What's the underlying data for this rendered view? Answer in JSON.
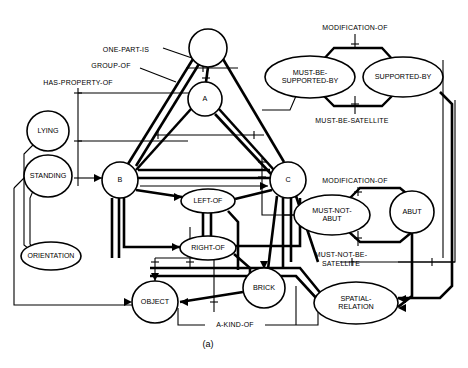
{
  "figure": {
    "caption": "(a)",
    "background_color": "#ffffff",
    "ink_color": "#000000"
  },
  "nodes": [
    {
      "id": "top",
      "label": "",
      "shape": "circle",
      "cx": 208,
      "cy": 48,
      "rx": 19,
      "ry": 19,
      "lines": []
    },
    {
      "id": "a",
      "label": "A",
      "shape": "circle",
      "cx": 205,
      "cy": 99,
      "rx": 17,
      "ry": 17,
      "lines": [
        "A"
      ]
    },
    {
      "id": "b",
      "label": "B",
      "shape": "circle",
      "cx": 120,
      "cy": 180,
      "rx": 18,
      "ry": 18,
      "lines": [
        "B"
      ]
    },
    {
      "id": "c",
      "label": "C",
      "shape": "circle",
      "cx": 288,
      "cy": 180,
      "rx": 18,
      "ry": 18,
      "lines": [
        "C"
      ]
    },
    {
      "id": "lying",
      "label": "LYING",
      "shape": "circle",
      "cx": 48,
      "cy": 131,
      "rx": 21,
      "ry": 20,
      "lines": [
        "LYING"
      ]
    },
    {
      "id": "standing",
      "label": "STANDING",
      "shape": "circle",
      "cx": 48,
      "cy": 176,
      "rx": 24,
      "ry": 21,
      "lines": [
        "STANDING"
      ]
    },
    {
      "id": "orientation",
      "label": "ORIENTATION",
      "shape": "ellipse",
      "cx": 51,
      "cy": 256,
      "rx": 30,
      "ry": 14,
      "lines": [
        "ORIENTATION"
      ]
    },
    {
      "id": "leftof",
      "label": "LEFT-OF",
      "shape": "ellipse",
      "cx": 208,
      "cy": 201,
      "rx": 27,
      "ry": 12,
      "lines": [
        "LEFT-OF"
      ]
    },
    {
      "id": "rightof",
      "label": "RIGHT-OF",
      "shape": "ellipse",
      "cx": 208,
      "cy": 248,
      "rx": 28,
      "ry": 12,
      "lines": [
        "RIGHT-OF"
      ]
    },
    {
      "id": "object",
      "label": "OBJECT",
      "shape": "circle",
      "cx": 155,
      "cy": 302,
      "rx": 23,
      "ry": 21,
      "lines": [
        "OBJECT"
      ]
    },
    {
      "id": "brick",
      "label": "BRICK",
      "shape": "circle",
      "cx": 264,
      "cy": 288,
      "rx": 21,
      "ry": 20,
      "lines": [
        "BRICK"
      ]
    },
    {
      "id": "mustbesup",
      "label": "MUST-BE-SUPPORTED-BY",
      "shape": "ellipse",
      "cx": 310,
      "cy": 77,
      "rx": 45,
      "ry": 21,
      "lines": [
        "MUST-BE-",
        "SUPPORTED-BY"
      ]
    },
    {
      "id": "supportedby",
      "label": "SUPPORTED-BY",
      "shape": "ellipse",
      "cx": 403,
      "cy": 77,
      "rx": 40,
      "ry": 20,
      "lines": [
        "SUPPORTED-BY"
      ]
    },
    {
      "id": "mustnotabut",
      "label": "MUST-NOT-ABUT",
      "shape": "ellipse",
      "cx": 332,
      "cy": 215,
      "rx": 38,
      "ry": 20,
      "lines": [
        "MUST-NOT-",
        "ABUT"
      ]
    },
    {
      "id": "abut",
      "label": "ABUT",
      "shape": "circle",
      "cx": 412,
      "cy": 212,
      "rx": 22,
      "ry": 21,
      "lines": [
        "ABUT"
      ]
    },
    {
      "id": "spatialrel",
      "label": "SPATIAL-RELATION",
      "shape": "ellipse",
      "cx": 356,
      "cy": 303,
      "rx": 42,
      "ry": 21,
      "lines": [
        "SPATIAL-",
        "RELATION"
      ]
    }
  ],
  "edge_labels": [
    {
      "id": "one-part-is",
      "text": "ONE-PART-IS",
      "x": 126,
      "y": 50,
      "anchor": "middle",
      "size": 7.0
    },
    {
      "id": "group-of",
      "text": "GROUP-OF",
      "x": 111,
      "y": 66,
      "anchor": "middle",
      "size": 7.0
    },
    {
      "id": "has-property-of",
      "text": "HAS-PROPERTY-OF",
      "x": 78,
      "y": 83,
      "anchor": "middle",
      "size": 7.0
    },
    {
      "id": "modification-of-top",
      "text": "MODIFICATION-OF",
      "x": 355,
      "y": 28,
      "anchor": "middle",
      "size": 7.0
    },
    {
      "id": "must-be-satellite",
      "text": "MUST-BE-SATELLITE",
      "x": 352,
      "y": 121,
      "anchor": "middle",
      "size": 7.0
    },
    {
      "id": "modification-of-bot",
      "text": "MODIFICATION-OF",
      "x": 355,
      "y": 181,
      "anchor": "middle",
      "size": 7.0
    },
    {
      "id": "must-not-be-sat-1",
      "text": "MUST-NOT-BE-",
      "x": 341,
      "y": 255,
      "anchor": "middle",
      "size": 7.0
    },
    {
      "id": "must-not-be-sat-2",
      "text": "SATELLITE",
      "x": 341,
      "y": 264,
      "anchor": "middle",
      "size": 7.0
    },
    {
      "id": "a-kind-of",
      "text": "A-KIND-OF",
      "x": 235,
      "y": 325,
      "anchor": "middle",
      "size": 7.0
    }
  ],
  "relations": [
    "ONE-PART-IS",
    "GROUP-OF",
    "HAS-PROPERTY-OF",
    "MODIFICATION-OF",
    "MUST-BE-SATELLITE",
    "MUST-NOT-BE-SATELLITE",
    "A-KIND-OF"
  ]
}
